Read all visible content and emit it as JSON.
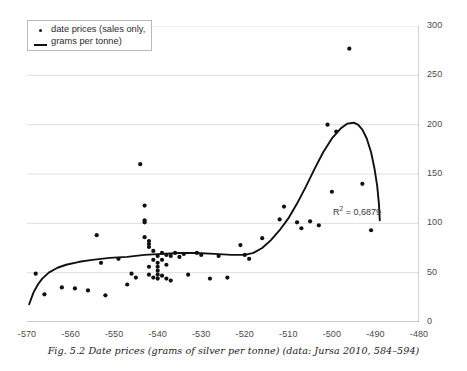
{
  "chart_data": {
    "type": "scatter",
    "title": "",
    "xlabel": "",
    "ylabel": "",
    "xlim": [
      -570,
      -480
    ],
    "ylim": [
      0,
      300
    ],
    "grid": true,
    "xticks": [
      -570,
      -560,
      -550,
      -540,
      -530,
      -520,
      -510,
      -500,
      -490,
      -480
    ],
    "yticks": [
      0,
      50,
      100,
      150,
      200,
      250,
      300
    ],
    "xtick_labels": [
      "-570",
      "-560",
      "-550",
      "-540",
      "-530",
      "-520",
      "-510",
      "-500",
      "-490",
      "-480"
    ],
    "ytick_labels": [
      "0",
      "50",
      "100",
      "150",
      "200",
      "250",
      "300"
    ],
    "y_axis_position": "right",
    "legend": {
      "position": "top-left",
      "entries": [
        {
          "marker": "dot",
          "label_line1": "date prices (sales only,",
          "label_line2": "grams per tonne)"
        },
        {
          "marker": "line",
          "label_line1": "",
          "label_line2": ""
        }
      ]
    },
    "annotations": [
      {
        "text_prefix": "R",
        "text_sup": "2",
        "text_suffix": " = 0,6879",
        "x": -500,
        "y": 108
      }
    ],
    "series": [
      {
        "name": "date prices (sales only, grams per tonne)",
        "type": "scatter",
        "color": "#111111",
        "points": [
          [
            -568,
            49
          ],
          [
            -566,
            28
          ],
          [
            -562,
            35
          ],
          [
            -559,
            34
          ],
          [
            -556,
            32
          ],
          [
            -554,
            88
          ],
          [
            -553,
            60
          ],
          [
            -552,
            27
          ],
          [
            -549,
            64
          ],
          [
            -547,
            38
          ],
          [
            -546,
            49
          ],
          [
            -545,
            45
          ],
          [
            -544,
            160
          ],
          [
            -543,
            118
          ],
          [
            -543,
            103
          ],
          [
            -543,
            101
          ],
          [
            -543,
            86
          ],
          [
            -542,
            82
          ],
          [
            -542,
            79
          ],
          [
            -542,
            76
          ],
          [
            -542,
            56
          ],
          [
            -542,
            48
          ],
          [
            -541,
            72
          ],
          [
            -541,
            63
          ],
          [
            -541,
            45
          ],
          [
            -540,
            67
          ],
          [
            -540,
            60
          ],
          [
            -540,
            56
          ],
          [
            -540,
            52
          ],
          [
            -540,
            48
          ],
          [
            -540,
            44
          ],
          [
            -539,
            70
          ],
          [
            -539,
            63
          ],
          [
            -539,
            47
          ],
          [
            -538,
            68
          ],
          [
            -538,
            58
          ],
          [
            -538,
            44
          ],
          [
            -537,
            67
          ],
          [
            -537,
            42
          ],
          [
            -536,
            70
          ],
          [
            -535,
            66
          ],
          [
            -534,
            69
          ],
          [
            -533,
            48
          ],
          [
            -531,
            70
          ],
          [
            -530,
            68
          ],
          [
            -528,
            44
          ],
          [
            -526,
            67
          ],
          [
            -524,
            45
          ],
          [
            -521,
            78
          ],
          [
            -520,
            68
          ],
          [
            -519,
            64
          ],
          [
            -516,
            85
          ],
          [
            -512,
            104
          ],
          [
            -511,
            117
          ],
          [
            -508,
            101
          ],
          [
            -507,
            95
          ],
          [
            -505,
            102
          ],
          [
            -503,
            98
          ],
          [
            -501,
            200
          ],
          [
            -500,
            132
          ],
          [
            -499,
            193
          ],
          [
            -496,
            277
          ],
          [
            -493,
            140
          ],
          [
            -491,
            93
          ]
        ]
      },
      {
        "name": "polynomial trend line",
        "type": "line",
        "color": "#111111",
        "r_squared": 0.6879,
        "points": [
          [
            -569.5,
            18
          ],
          [
            -568.5,
            30
          ],
          [
            -567.5,
            38
          ],
          [
            -566.5,
            44
          ],
          [
            -565,
            50
          ],
          [
            -563,
            55
          ],
          [
            -561,
            58
          ],
          [
            -558,
            61
          ],
          [
            -555,
            63
          ],
          [
            -551,
            65
          ],
          [
            -547,
            66
          ],
          [
            -543,
            68
          ],
          [
            -539,
            69
          ],
          [
            -535,
            70
          ],
          [
            -531,
            70
          ],
          [
            -527,
            69
          ],
          [
            -523,
            68
          ],
          [
            -520,
            68
          ],
          [
            -518,
            70
          ],
          [
            -516,
            75
          ],
          [
            -514,
            83
          ],
          [
            -512,
            93
          ],
          [
            -510,
            105
          ],
          [
            -508,
            120
          ],
          [
            -506,
            137
          ],
          [
            -504,
            155
          ],
          [
            -502,
            172
          ],
          [
            -500,
            186
          ],
          [
            -498,
            196
          ],
          [
            -496.5,
            201
          ],
          [
            -495,
            202
          ],
          [
            -494,
            200
          ],
          [
            -493,
            195
          ],
          [
            -492,
            186
          ],
          [
            -491,
            172
          ],
          [
            -490.2,
            155
          ],
          [
            -489.6,
            138
          ],
          [
            -489.2,
            120
          ],
          [
            -489,
            103
          ]
        ]
      }
    ]
  },
  "caption": {
    "text": "Fig. 5.2  Date prices (grams of silver per tonne) (data: Jursa 2010, 584–594)"
  },
  "colors": {
    "marker": "#111111",
    "trend_line": "#111111",
    "grid": "#d6d6d6",
    "axis": "#9a9a9a",
    "tick_text": "#4a4a4a"
  }
}
